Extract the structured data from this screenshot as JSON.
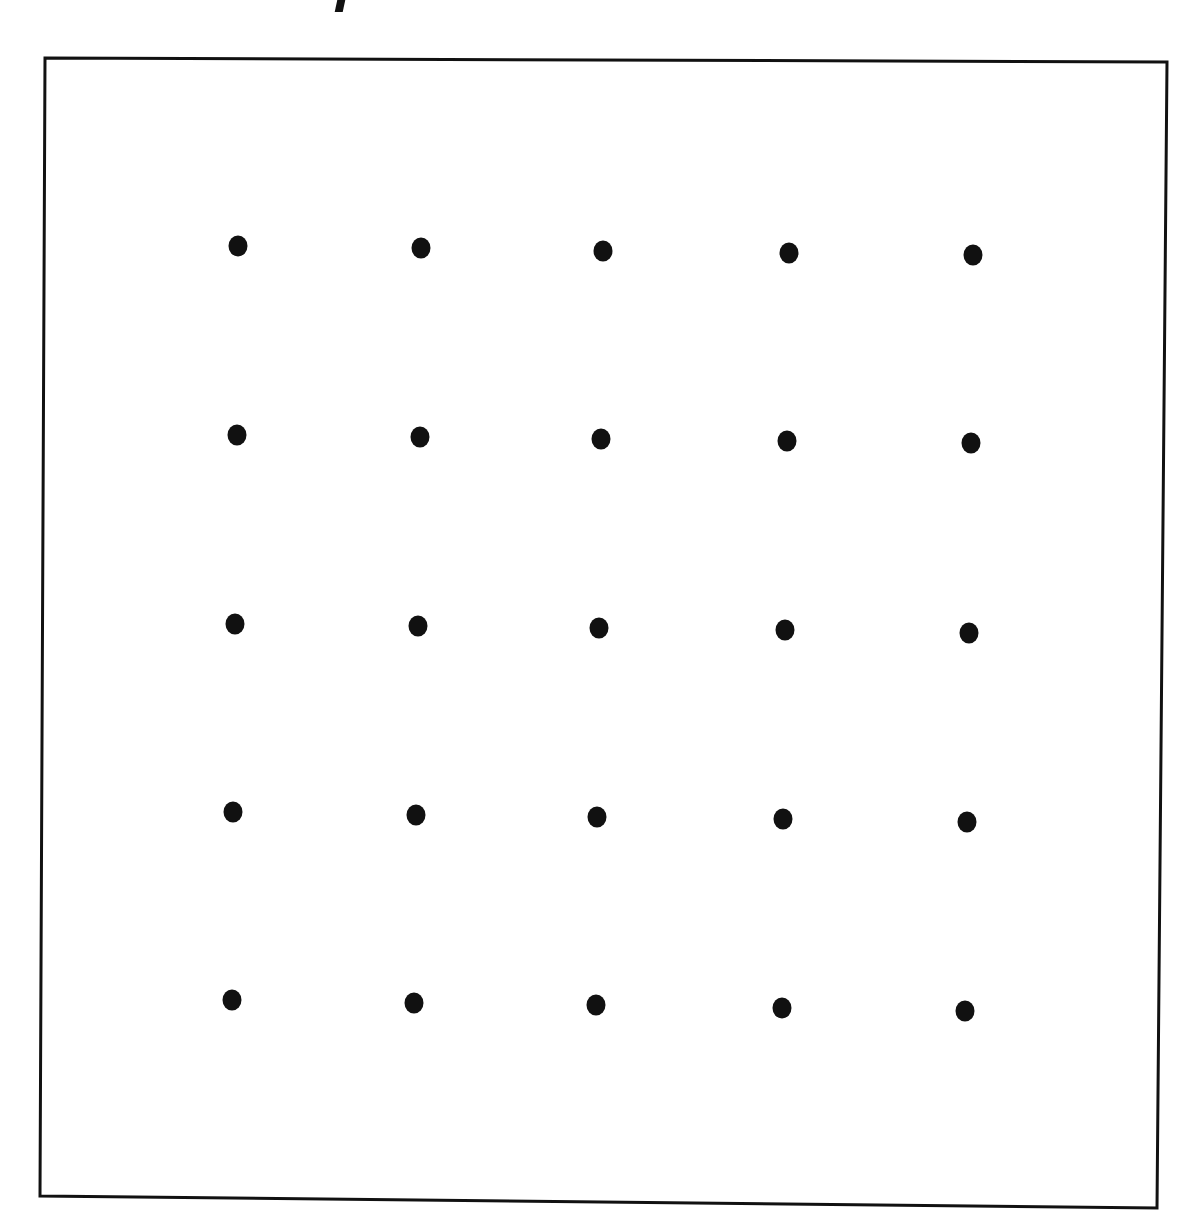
{
  "diagram": {
    "type": "dot-grid",
    "rows": 5,
    "columns": 5,
    "dot_color": "#111111",
    "dot_radius": 10,
    "frame": {
      "stroke_color": "#111111",
      "stroke_width": 3,
      "corners": {
        "top_left": [
          45,
          58
        ],
        "top_right": [
          1167,
          62
        ],
        "bottom_right": [
          1157,
          1208
        ],
        "bottom_left": [
          40,
          1196
        ]
      }
    },
    "dots": [
      [
        [
          238,
          246
        ],
        [
          421,
          248
        ],
        [
          603,
          251
        ],
        [
          789,
          253
        ],
        [
          973,
          255
        ]
      ],
      [
        [
          237,
          435
        ],
        [
          420,
          437
        ],
        [
          601,
          439
        ],
        [
          787,
          441
        ],
        [
          971,
          443
        ]
      ],
      [
        [
          235,
          624
        ],
        [
          418,
          626
        ],
        [
          599,
          628
        ],
        [
          785,
          630
        ],
        [
          969,
          633
        ]
      ],
      [
        [
          233,
          812
        ],
        [
          416,
          815
        ],
        [
          597,
          817
        ],
        [
          783,
          819
        ],
        [
          967,
          822
        ]
      ],
      [
        [
          232,
          1000
        ],
        [
          414,
          1003
        ],
        [
          596,
          1005
        ],
        [
          782,
          1008
        ],
        [
          965,
          1011
        ]
      ]
    ]
  }
}
